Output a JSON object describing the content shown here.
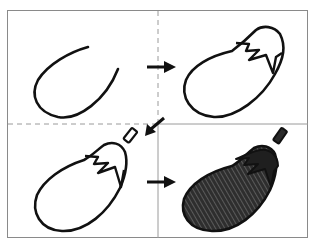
{
  "figure": {
    "title": "",
    "panels": [
      {
        "step": 1,
        "name": "draw-body-curve",
        "style": "outline"
      },
      {
        "step": 2,
        "name": "close-body-add-cap",
        "style": "outline"
      },
      {
        "step": 3,
        "name": "add-stem",
        "style": "outline"
      },
      {
        "step": 4,
        "name": "color-in",
        "style": "filled-hatched"
      }
    ],
    "arrows": [
      {
        "from": 1,
        "to": 2,
        "direction": "right"
      },
      {
        "from": 2,
        "to": 3,
        "direction": "down-left"
      },
      {
        "from": 3,
        "to": 4,
        "direction": "right"
      }
    ],
    "colors": {
      "line": "#111111",
      "frame": "#8a8a8a",
      "divider": "#9a9a9a",
      "fill": "#2e2e2e",
      "background": "#ffffff"
    }
  }
}
